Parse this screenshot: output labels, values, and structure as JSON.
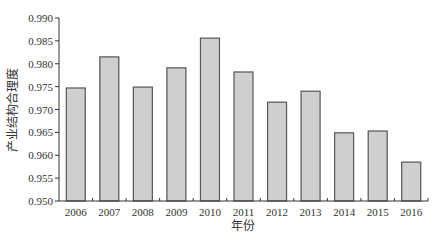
{
  "chart_data": {
    "type": "bar",
    "title": "",
    "xlabel": "年份",
    "ylabel": "产业结构合理度",
    "categories": [
      "2006",
      "2007",
      "2008",
      "2009",
      "2010",
      "2011",
      "2012",
      "2013",
      "2014",
      "2015",
      "2016"
    ],
    "values": [
      0.9747,
      0.9815,
      0.9749,
      0.9791,
      0.9856,
      0.9782,
      0.9716,
      0.974,
      0.9649,
      0.9653,
      0.9585
    ],
    "ylim": [
      0.95,
      0.99
    ],
    "yticks": [
      "0.950",
      "0.955",
      "0.960",
      "0.965",
      "0.970",
      "0.975",
      "0.980",
      "0.985",
      "0.990"
    ],
    "grid": false,
    "legend": null,
    "colors": {
      "bar_fill": "#cfcfcf",
      "bar_stroke": "#555555",
      "axis": "#333333"
    }
  }
}
